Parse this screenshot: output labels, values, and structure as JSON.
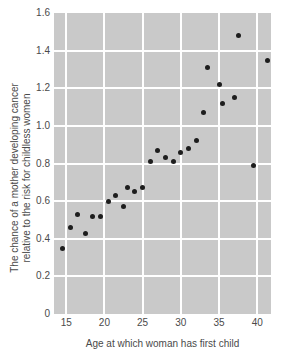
{
  "figure": {
    "x_axis_title": "Age at which woman has first child",
    "y_axis_title_line1": "The chance of a mother developing cancer",
    "y_axis_title_line2": "relative to the risk for childless women"
  },
  "chart_data": {
    "type": "scatter",
    "title": "",
    "xlabel": "Age at which woman has first child",
    "ylabel": "The chance of a mother developing cancer relative to the risk for childless women",
    "xlim": [
      13.4,
      41.8
    ],
    "ylim": [
      0,
      1.6
    ],
    "x_tick_labels": [
      "15",
      "20",
      "25",
      "30",
      "35",
      "40"
    ],
    "y_tick_labels": [
      "0",
      "0.2",
      "0.4",
      "0.6",
      "0.8",
      "1.0",
      "1.2",
      "1.4",
      "1.6"
    ],
    "grid": true,
    "legend": false,
    "colors": {
      "plot_background": "#c9c9c9",
      "gridline": "#ffffff",
      "point": "#1d1d1d",
      "text": "#4a4a4a",
      "page_background": "#ffffff"
    },
    "points": [
      {
        "x": 14.5,
        "y": 0.35
      },
      {
        "x": 15.5,
        "y": 0.46
      },
      {
        "x": 16.5,
        "y": 0.53
      },
      {
        "x": 17.5,
        "y": 0.43
      },
      {
        "x": 18.5,
        "y": 0.52
      },
      {
        "x": 19.5,
        "y": 0.52
      },
      {
        "x": 20.5,
        "y": 0.6
      },
      {
        "x": 21.5,
        "y": 0.63
      },
      {
        "x": 22.5,
        "y": 0.57
      },
      {
        "x": 23.0,
        "y": 0.67
      },
      {
        "x": 24.0,
        "y": 0.65
      },
      {
        "x": 25.0,
        "y": 0.67
      },
      {
        "x": 26.0,
        "y": 0.81
      },
      {
        "x": 27.0,
        "y": 0.87
      },
      {
        "x": 28.0,
        "y": 0.83
      },
      {
        "x": 29.0,
        "y": 0.81
      },
      {
        "x": 30.0,
        "y": 0.86
      },
      {
        "x": 31.0,
        "y": 0.88
      },
      {
        "x": 32.0,
        "y": 0.92
      },
      {
        "x": 33.0,
        "y": 1.07
      },
      {
        "x": 33.5,
        "y": 1.31
      },
      {
        "x": 35.0,
        "y": 1.22
      },
      {
        "x": 35.5,
        "y": 1.12
      },
      {
        "x": 37.0,
        "y": 1.15
      },
      {
        "x": 37.5,
        "y": 1.48
      },
      {
        "x": 39.5,
        "y": 0.79
      },
      {
        "x": 41.3,
        "y": 1.35
      }
    ]
  }
}
